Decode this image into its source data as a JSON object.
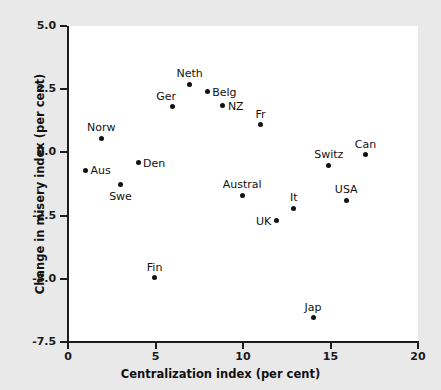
{
  "chart_data": {
    "type": "scatter",
    "title": "",
    "xlabel": "Centralization index (per cent)",
    "ylabel": "Change in misery index (per cent)",
    "xlim": [
      0,
      20
    ],
    "ylim": [
      -7.5,
      5.0
    ],
    "xticks": [
      "0",
      "5",
      "10",
      "15",
      "20"
    ],
    "xtick_values": [
      0,
      5,
      10,
      15,
      20
    ],
    "yticks": [
      "5.0",
      "2.5",
      "0.0",
      "-2.5",
      "-5.0",
      "-7.5"
    ],
    "ytick_values": [
      5.0,
      2.5,
      0.0,
      -2.5,
      -5.0,
      -7.5
    ],
    "grid": false,
    "legend": "none",
    "marker_color": "#111111",
    "panel_color": "#ffffff",
    "background_color": "#e9e9e9",
    "points": [
      {
        "label": "Aus",
        "x": 1.0,
        "y": -0.7,
        "label_pos": "right"
      },
      {
        "label": "Norw",
        "x": 1.9,
        "y": 0.55,
        "label_pos": "above"
      },
      {
        "label": "Swe",
        "x": 3.0,
        "y": -1.25,
        "label_pos": "below"
      },
      {
        "label": "Den",
        "x": 4.0,
        "y": -0.4,
        "label_pos": "right"
      },
      {
        "label": "Fin",
        "x": 4.95,
        "y": -4.95,
        "label_pos": "above"
      },
      {
        "label": "Ger",
        "x": 5.95,
        "y": 1.8,
        "label_pos": "above-left"
      },
      {
        "label": "Neth",
        "x": 6.95,
        "y": 2.7,
        "label_pos": "above"
      },
      {
        "label": "Belg",
        "x": 7.95,
        "y": 2.4,
        "label_pos": "right"
      },
      {
        "label": "NZ",
        "x": 8.85,
        "y": 1.85,
        "label_pos": "right"
      },
      {
        "label": "Austral",
        "x": 9.95,
        "y": -1.7,
        "label_pos": "above"
      },
      {
        "label": "Fr",
        "x": 11.0,
        "y": 1.1,
        "label_pos": "above"
      },
      {
        "label": "UK",
        "x": 11.9,
        "y": -2.7,
        "label_pos": "left"
      },
      {
        "label": "It",
        "x": 12.9,
        "y": -2.2,
        "label_pos": "above"
      },
      {
        "label": "Jap",
        "x": 14.0,
        "y": -6.55,
        "label_pos": "above"
      },
      {
        "label": "Switz",
        "x": 14.9,
        "y": -0.5,
        "label_pos": "above"
      },
      {
        "label": "USA",
        "x": 15.9,
        "y": -1.9,
        "label_pos": "above"
      },
      {
        "label": "Can",
        "x": 17.0,
        "y": -0.1,
        "label_pos": "above"
      }
    ]
  }
}
